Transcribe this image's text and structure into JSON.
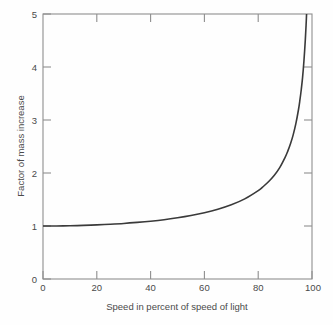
{
  "chart_data": {
    "type": "line",
    "title": "",
    "xlabel": "Speed in percent of speed of light",
    "ylabel": "Factor of mass increase",
    "xlim": [
      0,
      100
    ],
    "ylim": [
      0,
      5
    ],
    "xticks": [
      "0",
      "20",
      "40",
      "60",
      "80",
      "100"
    ],
    "xtick_values": [
      0,
      20,
      40,
      60,
      80,
      100
    ],
    "yticks": [
      "0",
      "1",
      "2",
      "3",
      "4",
      "5"
    ],
    "ytick_values": [
      0,
      1,
      2,
      3,
      4,
      5
    ],
    "grid": false,
    "legend": false,
    "series": [
      {
        "name": "Lorentz factor",
        "x": [
          0,
          5,
          10,
          15,
          20,
          25,
          30,
          35,
          40,
          45,
          50,
          55,
          60,
          65,
          70,
          75,
          80,
          82,
          84,
          86,
          88,
          90,
          91,
          92,
          93,
          94,
          95,
          95.5,
          96,
          96.5,
          97,
          97.5,
          97.8,
          98,
          98.2
        ],
        "values": [
          1.0,
          1.001,
          1.005,
          1.011,
          1.021,
          1.033,
          1.048,
          1.068,
          1.091,
          1.119,
          1.155,
          1.198,
          1.25,
          1.316,
          1.4,
          1.512,
          1.667,
          1.75,
          1.844,
          1.957,
          2.1,
          2.294,
          2.412,
          2.551,
          2.72,
          2.931,
          3.203,
          3.374,
          3.571,
          3.803,
          4.113,
          4.497,
          4.789,
          5.025,
          5.3
        ]
      }
    ],
    "annotations": []
  },
  "axis": {
    "y_label": "Factor of mass increase",
    "x_label": "Speed in percent of speed of light"
  }
}
